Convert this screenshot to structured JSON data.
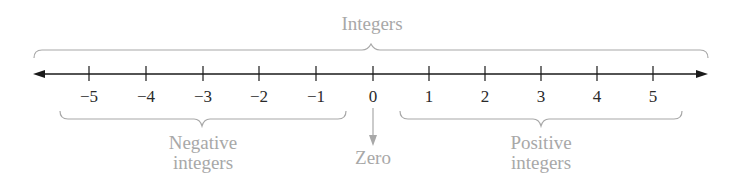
{
  "diagram": {
    "title": "Integers",
    "axis": {
      "ticks": [
        {
          "value": -5,
          "label": "−5",
          "x": 89
        },
        {
          "value": -4,
          "label": "−4",
          "x": 146
        },
        {
          "value": -3,
          "label": "−3",
          "x": 203
        },
        {
          "value": -2,
          "label": "−2",
          "x": 259
        },
        {
          "value": -1,
          "label": "−1",
          "x": 316
        },
        {
          "value": 0,
          "label": "0",
          "x": 373
        },
        {
          "value": 1,
          "label": "1",
          "x": 429
        },
        {
          "value": 2,
          "label": "2",
          "x": 485
        },
        {
          "value": 3,
          "label": "3",
          "x": 541
        },
        {
          "value": 4,
          "label": "4",
          "x": 597
        },
        {
          "value": 5,
          "label": "5",
          "x": 653
        }
      ],
      "arrows": "both-directions"
    },
    "groups": {
      "negative": {
        "line1": "Negative",
        "line2": "integers"
      },
      "zero": {
        "label": "Zero"
      },
      "positive": {
        "line1": "Positive",
        "line2": "integers"
      }
    },
    "colors": {
      "axis": "#1a1a1a",
      "annotation": "#a8a8a8"
    }
  }
}
